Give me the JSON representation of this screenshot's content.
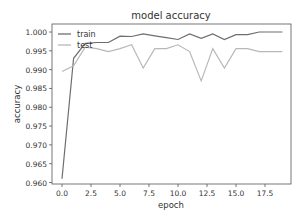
{
  "chart_data": {
    "type": "line",
    "title": "model accuracy",
    "xlabel": "epoch",
    "ylabel": "accuracy",
    "x": [
      0,
      1,
      2,
      3,
      4,
      5,
      6,
      7,
      8,
      9,
      10,
      11,
      12,
      13,
      14,
      15,
      16,
      17,
      18,
      19
    ],
    "xlim": [
      -0.9,
      19.9
    ],
    "ylim": [
      0.9597,
      1.0021
    ],
    "xticks": [
      0.0,
      2.5,
      5.0,
      7.5,
      10.0,
      12.5,
      15.0,
      17.5
    ],
    "xtick_labels": [
      "0.0",
      "2.5",
      "5.0",
      "7.5",
      "10.0",
      "12.5",
      "15.0",
      "17.5"
    ],
    "yticks": [
      0.96,
      0.965,
      0.97,
      0.975,
      0.98,
      0.985,
      0.99,
      0.995,
      1.0
    ],
    "ytick_labels": [
      "0.960",
      "0.965",
      "0.970",
      "0.975",
      "0.980",
      "0.985",
      "0.990",
      "0.995",
      "1.000"
    ],
    "grid": false,
    "legend_position": "upper left",
    "series": [
      {
        "name": "train",
        "color": "#6e6e6e",
        "values": [
          0.961,
          0.993,
          0.997,
          0.9972,
          0.9972,
          0.9989,
          0.9988,
          0.9995,
          0.999,
          0.9985,
          0.998,
          0.9995,
          0.9983,
          0.9995,
          0.998,
          0.9993,
          0.9993,
          1.0,
          1.0,
          1.0
        ]
      },
      {
        "name": "test",
        "color": "#b8b8b8",
        "values": [
          0.9895,
          0.991,
          0.996,
          0.9956,
          0.9948,
          0.9956,
          0.9966,
          0.9904,
          0.9956,
          0.9956,
          0.9966,
          0.9948,
          0.987,
          0.9956,
          0.9904,
          0.9956,
          0.9956,
          0.9948,
          0.9948,
          0.9948
        ]
      }
    ]
  },
  "legend": {
    "items": [
      "train",
      "test"
    ]
  }
}
